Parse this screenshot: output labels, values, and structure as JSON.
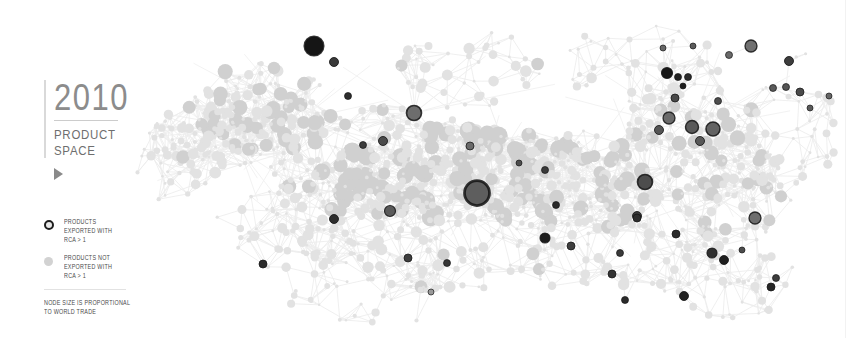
{
  "header": {
    "year": "2010",
    "subtitle_line1": "PRODUCT",
    "subtitle_line2": "SPACE",
    "play_icon": "play-triangle-icon"
  },
  "legend": {
    "items": [
      {
        "marker": "ring-marker",
        "line1": "PRODUCTS",
        "line2": "EXPORTED WITH",
        "line3": "RCA > 1"
      },
      {
        "marker": "dot-marker",
        "line1": "PRODUCTS NOT",
        "line2": "EXPORTED WITH",
        "line3": "RCA > 1"
      }
    ],
    "footnote_line1": "NODE SIZE IS PROPORTIONAL",
    "footnote_line2": "TO WORLD TRADE"
  },
  "colors": {
    "background": "#ffffff",
    "node_inactive": "#e2e2e2",
    "node_inactive_mid": "#d0d0d0",
    "node_active_dark": "#1f1f1f",
    "node_active_mid": "#5c5c5c",
    "node_active_light": "#8f8f8f",
    "edge": "#ededed",
    "title_text": "#8c8c8c",
    "body_text": "#4a4a4a"
  },
  "chart_data": {
    "type": "scatter",
    "title": "2010 Product Space",
    "xlabel": "",
    "ylabel": "",
    "grid": false,
    "legend_position": "left",
    "xlim": [
      130,
      840
    ],
    "ylim": [
      20,
      320
    ],
    "edges_color": "#ededed",
    "series": [
      {
        "name": "Products exported with RCA > 1",
        "marker": "dark-filled-circle"
      },
      {
        "name": "Products not exported with RCA > 1",
        "marker": "light-filled-circle"
      }
    ],
    "nodes": [
      {
        "x": 314,
        "y": 46,
        "r": 9.5,
        "active": true,
        "shade": "#151515"
      },
      {
        "x": 334,
        "y": 62,
        "r": 4.5,
        "active": true,
        "shade": "#3a3a3a"
      },
      {
        "x": 348,
        "y": 96,
        "r": 3.5,
        "active": true,
        "shade": "#2e2e2e"
      },
      {
        "x": 414,
        "y": 113,
        "r": 7.5,
        "active": true,
        "shade": "#6d6d6d"
      },
      {
        "x": 383,
        "y": 141,
        "r": 4.5,
        "active": true,
        "shade": "#4a4a4a"
      },
      {
        "x": 363,
        "y": 145,
        "r": 3.5,
        "active": true,
        "shade": "#3c3c3c"
      },
      {
        "x": 334,
        "y": 219,
        "r": 4.5,
        "active": true,
        "shade": "#2d2d2d"
      },
      {
        "x": 390,
        "y": 211,
        "r": 5.5,
        "active": true,
        "shade": "#5a5a5a"
      },
      {
        "x": 477,
        "y": 193,
        "r": 12.5,
        "active": true,
        "shade": "#5e5e5e"
      },
      {
        "x": 470,
        "y": 146,
        "r": 4.0,
        "active": true,
        "shade": "#6a6a6a"
      },
      {
        "x": 519,
        "y": 163,
        "r": 3.0,
        "active": true,
        "shade": "#4d4d4d"
      },
      {
        "x": 545,
        "y": 170,
        "r": 3.5,
        "active": true,
        "shade": "#3a3a3a"
      },
      {
        "x": 556,
        "y": 205,
        "r": 3.5,
        "active": true,
        "shade": "#2a2a2a"
      },
      {
        "x": 545,
        "y": 238,
        "r": 5.0,
        "active": true,
        "shade": "#1e1e1e"
      },
      {
        "x": 571,
        "y": 246,
        "r": 4.0,
        "active": true,
        "shade": "#3f3f3f"
      },
      {
        "x": 263,
        "y": 264,
        "r": 4.0,
        "active": true,
        "shade": "#2a2a2a"
      },
      {
        "x": 408,
        "y": 258,
        "r": 4.0,
        "active": true,
        "shade": "#3e3e3e"
      },
      {
        "x": 447,
        "y": 263,
        "r": 3.5,
        "active": true,
        "shade": "#363636"
      },
      {
        "x": 431,
        "y": 292,
        "r": 3.0,
        "active": true,
        "shade": "#9a9a9a"
      },
      {
        "x": 625,
        "y": 300,
        "r": 3.5,
        "active": true,
        "shade": "#2b2b2b"
      },
      {
        "x": 684,
        "y": 296,
        "r": 4.5,
        "active": true,
        "shade": "#1f1f1f"
      },
      {
        "x": 612,
        "y": 274,
        "r": 4.0,
        "active": true,
        "shade": "#333333"
      },
      {
        "x": 637,
        "y": 216,
        "r": 4.5,
        "active": true,
        "shade": "#3a3a3a"
      },
      {
        "x": 645,
        "y": 182,
        "r": 7.5,
        "active": true,
        "shade": "#4d4d4d"
      },
      {
        "x": 659,
        "y": 130,
        "r": 4.5,
        "active": true,
        "shade": "#545454"
      },
      {
        "x": 669,
        "y": 118,
        "r": 6.0,
        "active": true,
        "shade": "#6a6a6a"
      },
      {
        "x": 675,
        "y": 98,
        "r": 4.0,
        "active": true,
        "shade": "#4a4a4a"
      },
      {
        "x": 667,
        "y": 73,
        "r": 5.5,
        "active": true,
        "shade": "#171717"
      },
      {
        "x": 678,
        "y": 77,
        "r": 3.5,
        "active": true,
        "shade": "#222222"
      },
      {
        "x": 683,
        "y": 86,
        "r": 3.0,
        "active": true,
        "shade": "#1c1c1c"
      },
      {
        "x": 688,
        "y": 77,
        "r": 3.5,
        "active": true,
        "shade": "#2a2a2a"
      },
      {
        "x": 692,
        "y": 127,
        "r": 6.5,
        "active": true,
        "shade": "#5a5a5a"
      },
      {
        "x": 713,
        "y": 129,
        "r": 7.0,
        "active": true,
        "shade": "#646464"
      },
      {
        "x": 700,
        "y": 141,
        "r": 4.5,
        "active": true,
        "shade": "#585858"
      },
      {
        "x": 718,
        "y": 101,
        "r": 3.5,
        "active": true,
        "shade": "#4e4e4e"
      },
      {
        "x": 751,
        "y": 46,
        "r": 6.0,
        "active": true,
        "shade": "#707070"
      },
      {
        "x": 789,
        "y": 61,
        "r": 4.5,
        "active": true,
        "shade": "#3d3d3d"
      },
      {
        "x": 800,
        "y": 92,
        "r": 4.0,
        "active": true,
        "shade": "#4a4a4a"
      },
      {
        "x": 773,
        "y": 88,
        "r": 3.5,
        "active": true,
        "shade": "#5a5a5a"
      },
      {
        "x": 786,
        "y": 87,
        "r": 3.5,
        "active": true,
        "shade": "#555555"
      },
      {
        "x": 729,
        "y": 55,
        "r": 3.5,
        "active": true,
        "shade": "#6a6a6a"
      },
      {
        "x": 693,
        "y": 46,
        "r": 3.0,
        "active": true,
        "shade": "#5c5c5c"
      },
      {
        "x": 663,
        "y": 48,
        "r": 3.0,
        "active": true,
        "shade": "#666666"
      },
      {
        "x": 620,
        "y": 253,
        "r": 3.5,
        "active": true,
        "shade": "#3a3a3a"
      },
      {
        "x": 637,
        "y": 218,
        "r": 4.0,
        "active": true,
        "shade": "#2e2e2e"
      },
      {
        "x": 676,
        "y": 234,
        "r": 4.0,
        "active": true,
        "shade": "#2a2a2a"
      },
      {
        "x": 712,
        "y": 253,
        "r": 5.0,
        "active": true,
        "shade": "#2f2f2f"
      },
      {
        "x": 724,
        "y": 260,
        "r": 4.5,
        "active": true,
        "shade": "#1e1e1e"
      },
      {
        "x": 776,
        "y": 278,
        "r": 3.5,
        "active": true,
        "shade": "#3d3d3d"
      },
      {
        "x": 771,
        "y": 287,
        "r": 4.0,
        "active": true,
        "shade": "#252525"
      },
      {
        "x": 755,
        "y": 218,
        "r": 6.0,
        "active": true,
        "shade": "#6e6e6e"
      },
      {
        "x": 742,
        "y": 250,
        "r": 3.0,
        "active": true,
        "shade": "#4c4c4c"
      },
      {
        "x": 810,
        "y": 108,
        "r": 3.0,
        "active": true,
        "shade": "#5a5a5a"
      },
      {
        "x": 829,
        "y": 96,
        "r": 3.0,
        "active": true,
        "shade": "#666666"
      }
    ]
  }
}
